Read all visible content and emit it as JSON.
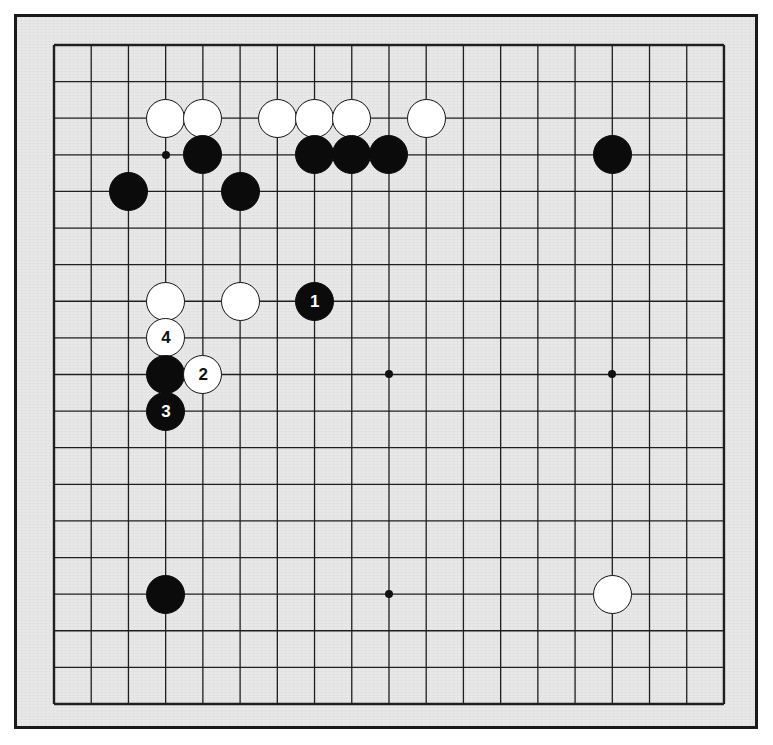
{
  "diagram": {
    "kind": "go-board-diagram",
    "board_size": 19,
    "background_color": "#e8e8e8",
    "page_color": "#ffffff",
    "border_color": "#1a1a1a",
    "line_color": "#1f1f1f",
    "black_color": "#0b0b0b",
    "white_color": "#ffffff",
    "grid": {
      "origin_x": 54,
      "origin_y": 45,
      "step_x": 37.22,
      "step_y": 36.61,
      "stone_radius": 19.5
    },
    "star_points": [
      {
        "col": 3,
        "row": 3
      },
      {
        "col": 9,
        "row": 3
      },
      {
        "col": 15,
        "row": 3
      },
      {
        "col": 3,
        "row": 9
      },
      {
        "col": 9,
        "row": 9
      },
      {
        "col": 15,
        "row": 9
      },
      {
        "col": 3,
        "row": 15
      },
      {
        "col": 9,
        "row": 15
      },
      {
        "col": 15,
        "row": 15
      }
    ],
    "stones": [
      {
        "id": "w-c3r2",
        "color": "white",
        "col": 3,
        "row": 2,
        "label": ""
      },
      {
        "id": "w-c4r2",
        "color": "white",
        "col": 4,
        "row": 2,
        "label": ""
      },
      {
        "id": "w-c6r2",
        "color": "white",
        "col": 6,
        "row": 2,
        "label": ""
      },
      {
        "id": "w-c7r2",
        "color": "white",
        "col": 7,
        "row": 2,
        "label": ""
      },
      {
        "id": "w-c8r2",
        "color": "white",
        "col": 8,
        "row": 2,
        "label": ""
      },
      {
        "id": "w-c10r2",
        "color": "white",
        "col": 10,
        "row": 2,
        "label": ""
      },
      {
        "id": "b-c4r3",
        "color": "black",
        "col": 4,
        "row": 3,
        "label": ""
      },
      {
        "id": "b-c7r3",
        "color": "black",
        "col": 7,
        "row": 3,
        "label": ""
      },
      {
        "id": "b-c8r3",
        "color": "black",
        "col": 8,
        "row": 3,
        "label": ""
      },
      {
        "id": "b-c9r3",
        "color": "black",
        "col": 9,
        "row": 3,
        "label": ""
      },
      {
        "id": "b-c15r3",
        "color": "black",
        "col": 15,
        "row": 3,
        "label": ""
      },
      {
        "id": "b-c2r4",
        "color": "black",
        "col": 2,
        "row": 4,
        "label": ""
      },
      {
        "id": "b-c5r4",
        "color": "black",
        "col": 5,
        "row": 4,
        "label": ""
      },
      {
        "id": "w-c3r7",
        "color": "white",
        "col": 3,
        "row": 7,
        "label": ""
      },
      {
        "id": "w-c5r7",
        "color": "white",
        "col": 5,
        "row": 7,
        "label": ""
      },
      {
        "id": "b-c7r7",
        "color": "black",
        "col": 7,
        "row": 7,
        "label": "1"
      },
      {
        "id": "w-c3r8",
        "color": "white",
        "col": 3,
        "row": 8,
        "label": "4"
      },
      {
        "id": "b-c3r9",
        "color": "black",
        "col": 3,
        "row": 9,
        "label": ""
      },
      {
        "id": "w-c4r9",
        "color": "white",
        "col": 4,
        "row": 9,
        "label": "2"
      },
      {
        "id": "b-c3r10",
        "color": "black",
        "col": 3,
        "row": 10,
        "label": "3"
      },
      {
        "id": "b-c3r15",
        "color": "black",
        "col": 3,
        "row": 15,
        "label": ""
      },
      {
        "id": "w-c15r15",
        "color": "white",
        "col": 15,
        "row": 15,
        "label": ""
      }
    ],
    "move_sequence": [
      {
        "number": "1",
        "color": "black",
        "col": 7,
        "row": 7
      },
      {
        "number": "2",
        "color": "white",
        "col": 4,
        "row": 9
      },
      {
        "number": "3",
        "color": "black",
        "col": 3,
        "row": 10
      },
      {
        "number": "4",
        "color": "white",
        "col": 3,
        "row": 8
      }
    ]
  }
}
